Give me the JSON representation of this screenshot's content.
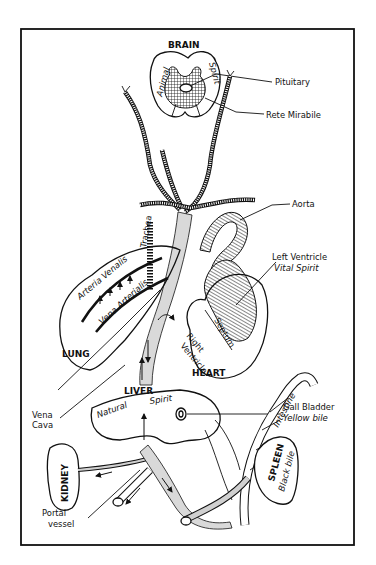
{
  "figure": {
    "labels": {
      "brain": "BRAIN",
      "animal_spirit_1": "Animal",
      "animal_spirit_2": "Spirit",
      "pituitary": "Pituitary",
      "rete_mirabile": "Rete Mirabile",
      "aorta": "Aorta",
      "left_ventricle": "Left Ventricle",
      "vital_spirit": "Vital Spirit",
      "trachea": "Trachea",
      "arteria_venalis": "Arteria Venalis",
      "vena_arterialis": "Vena Arterialis",
      "septum": "Septum",
      "right_ventricle_1": "Right",
      "right_ventricle_2": "Ventricle",
      "lung": "LUNG",
      "heart": "HEART",
      "liver": "LIVER",
      "natural_spirit_1": "Natural",
      "natural_spirit_2": "Spirit",
      "vena_cava_1": "Vena",
      "vena_cava_2": "Cava",
      "gall_bladder": "Gall Bladder",
      "yellow_bile": "Yellow bile",
      "intestine": "Intestine",
      "kidney": "KIDNEY",
      "spleen": "SPLEEN",
      "black_bile": "Black bile",
      "portal_vessel_1": "Portal",
      "portal_vessel_2": "vessel"
    }
  }
}
